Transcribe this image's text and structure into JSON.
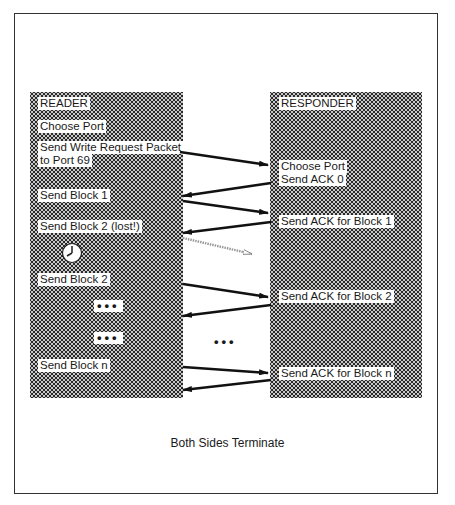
{
  "reader": {
    "title": "READER",
    "steps": [
      "Choose Port",
      "Send Write Request Packet",
      "to Port 69",
      "Send Block 1",
      "Send Block 2 (lost!)",
      "Send Block 2",
      "Send Block n"
    ],
    "ellipsis": "•••",
    "timer_icon": "clock-icon"
  },
  "responder": {
    "title": "RESPONDER",
    "steps": [
      "Choose Port",
      "Send ACK 0",
      "Send ACK for Block 1",
      "Send ACK for Block 2",
      "Send ACK for Block n"
    ]
  },
  "middle_ellipsis": "•••",
  "footer": {
    "caption": "Both Sides Terminate"
  },
  "arrows": [
    {
      "from": "reader",
      "to": "responder",
      "label": "write request"
    },
    {
      "from": "responder",
      "to": "reader",
      "label": "ACK 0"
    },
    {
      "from": "reader",
      "to": "responder",
      "label": "block 1"
    },
    {
      "from": "responder",
      "to": "reader",
      "label": "ACK block 1"
    },
    {
      "from": "reader",
      "to": "responder",
      "label": "block 2 lost",
      "style": "hollow"
    },
    {
      "from": "reader",
      "to": "responder",
      "label": "block 2"
    },
    {
      "from": "responder",
      "to": "reader",
      "label": "ACK block 2"
    },
    {
      "from": "reader",
      "to": "responder",
      "label": "block n"
    },
    {
      "from": "responder",
      "to": "reader",
      "label": "ACK block n"
    }
  ]
}
